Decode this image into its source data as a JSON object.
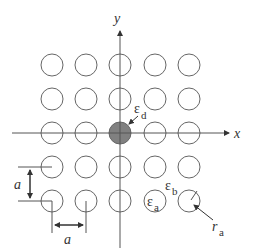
{
  "diagram": {
    "title": "",
    "type": "photonic crystal square lattice with point defect",
    "colors": {
      "line": "#555555",
      "circle_stroke": "#666666",
      "defect_fill": "#808080",
      "text": "#333333",
      "background": "#ffffff"
    },
    "axes": {
      "x_label": "x",
      "y_label": "y",
      "origin": [
        120,
        133
      ]
    },
    "lattice": {
      "rows": 5,
      "cols": 5,
      "centers_x": [
        52,
        86,
        120,
        155,
        189
      ],
      "centers_y": [
        65,
        99,
        133,
        167,
        201
      ],
      "radius": 11,
      "defect": {
        "row": 2,
        "col": 2
      }
    },
    "labels": {
      "defect_permittivity": "ε",
      "defect_sub": "d",
      "background_permittivity": "ε",
      "background_sub": "b",
      "rod_permittivity": "ε",
      "rod_sub": "a",
      "rod_radius": "r",
      "rod_radius_sub": "a",
      "lattice_constant_vertical": "a",
      "lattice_constant_horizontal": "a"
    }
  }
}
